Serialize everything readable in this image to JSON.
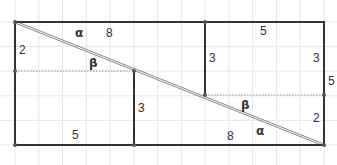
{
  "diagram": {
    "grid_units": {
      "width": 13,
      "height": 5
    },
    "colors": {
      "outline": "#333333",
      "grid": "#e6e6e6",
      "diagonal": "#888888",
      "dashed": "#999999"
    },
    "labels": {
      "top_left_8": "8",
      "top_right_5": "5",
      "left_2": "2",
      "mid_left_3": "3",
      "mid_right_3": "3",
      "right_3": "3",
      "right_outside_5": "5",
      "right_2": "2",
      "bottom_left_5": "5",
      "bottom_right_8": "8",
      "alpha_top": "α",
      "beta_top": "β",
      "beta_bottom": "β",
      "alpha_bottom": "α"
    }
  }
}
